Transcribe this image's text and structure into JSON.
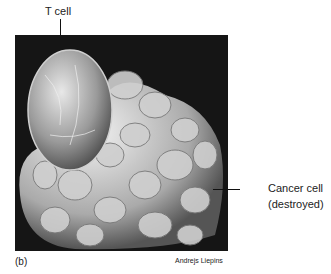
{
  "figure": {
    "panel_label": "(b)",
    "credit": "Andrejs Liepins",
    "labels": {
      "t_cell": "T cell",
      "cancer_cell_line1": "Cancer cell",
      "cancer_cell_line2": "(destroyed)"
    },
    "image_description": "Scanning electron micrograph of a T cell attacking a cancer cell"
  }
}
